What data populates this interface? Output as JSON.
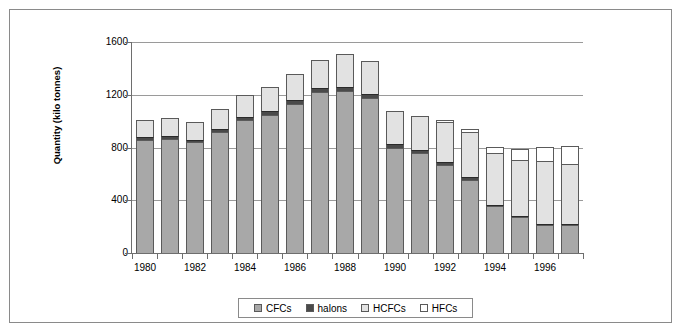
{
  "chart_data": {
    "type": "bar",
    "stacked": true,
    "title": "",
    "xlabel": "",
    "ylabel": "Quantity (kilo tonnes)",
    "ylim": [
      0,
      1600
    ],
    "yticks": [
      0,
      400,
      800,
      1200,
      1600
    ],
    "grid": true,
    "legend_position": "bottom",
    "categories": [
      "1980",
      "1981",
      "1982",
      "1983",
      "1984",
      "1985",
      "1986",
      "1987",
      "1988",
      "1989",
      "1990",
      "1991",
      "1992",
      "1993",
      "1994",
      "1995",
      "1996",
      "1997"
    ],
    "xtick_labels": [
      "1980",
      "1982",
      "1984",
      "1986",
      "1988",
      "1990",
      "1992",
      "1994",
      "1996"
    ],
    "series": [
      {
        "name": "CFCs",
        "color": "#a8a8a8",
        "values": [
          860,
          865,
          840,
          920,
          1010,
          1050,
          1130,
          1220,
          1225,
          1175,
          800,
          760,
          670,
          555,
          355,
          270,
          215,
          210
        ]
      },
      {
        "name": "halons",
        "color": "#4a4a4a",
        "values": [
          20,
          20,
          20,
          22,
          25,
          28,
          30,
          32,
          32,
          30,
          25,
          22,
          20,
          18,
          12,
          10,
          8,
          8
        ]
      },
      {
        "name": "HCFCs",
        "color": "#e2e2e2",
        "values": [
          125,
          140,
          130,
          150,
          165,
          180,
          200,
          215,
          250,
          250,
          250,
          260,
          300,
          345,
          390,
          425,
          475,
          455
        ]
      },
      {
        "name": "HFCs",
        "color": "#ffffff",
        "values": [
          0,
          0,
          0,
          0,
          0,
          0,
          0,
          0,
          0,
          0,
          0,
          0,
          20,
          20,
          45,
          85,
          105,
          135
        ]
      }
    ],
    "totals": [
      1005,
      1025,
      990,
      1092,
      1200,
      1258,
      1360,
      1467,
      1507,
      1455,
      1075,
      1042,
      1010,
      938,
      802,
      790,
      803,
      808
    ]
  },
  "legend": {
    "items": [
      {
        "label": "CFCs",
        "color": "#a8a8a8"
      },
      {
        "label": "halons",
        "color": "#4a4a4a"
      },
      {
        "label": "HCFCs",
        "color": "#e2e2e2"
      },
      {
        "label": "HFCs",
        "color": "#ffffff"
      }
    ]
  }
}
